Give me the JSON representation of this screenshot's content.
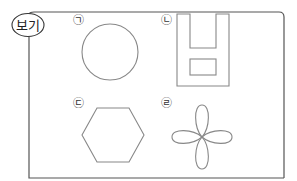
{
  "box": {
    "label": "보기",
    "border_color": "#555555",
    "shape_color": "#888888"
  },
  "items": [
    {
      "marker": "㉠",
      "shape": "circle"
    },
    {
      "marker": "㉡",
      "shape": "u-shape-with-rectangle"
    },
    {
      "marker": "㉢",
      "shape": "hexagon"
    },
    {
      "marker": "㉣",
      "shape": "four-petal-flower"
    }
  ]
}
